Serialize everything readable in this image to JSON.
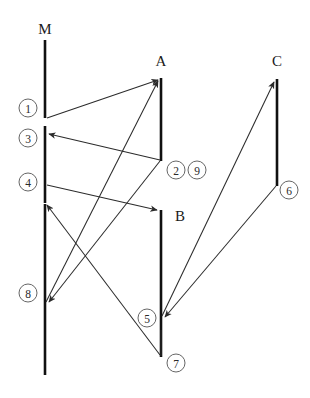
{
  "diagram": {
    "type": "sequence-diagram",
    "title": "",
    "canvas": {
      "width": 310,
      "height": 398,
      "background": "#ffffff"
    },
    "stroke_colors": {
      "lifeline": "#111111",
      "message": "#2b2b2b",
      "circle": "#555555",
      "text": "#1a1a1a"
    },
    "lifelines": [
      {
        "id": "M",
        "label": "M",
        "label_x": 45,
        "label_y": 30,
        "x": 45,
        "segments": [
          [
            40,
            118
          ],
          [
            126,
            203
          ],
          [
            203,
            375
          ]
        ]
      },
      {
        "id": "A",
        "label": "A",
        "label_x": 161,
        "label_y": 62,
        "x": 161,
        "segments": [
          [
            78,
            161
          ]
        ]
      },
      {
        "id": "B",
        "label": "B",
        "label_x": 178,
        "label_y": 216,
        "x": 161,
        "segments": [
          [
            210,
            357
          ]
        ]
      },
      {
        "id": "C",
        "label": "C",
        "label_x": 277,
        "label_y": 62,
        "x": 277,
        "segments": [
          [
            79,
            186
          ]
        ]
      }
    ],
    "messages": [
      {
        "num": "1",
        "circle_x": 28,
        "circle_y": 108,
        "x1": 46,
        "y1": 118,
        "x2": 160,
        "y2": 79,
        "arrow": "end"
      },
      {
        "num": "2",
        "circle_x": 176,
        "circle_y": 170,
        "x1": 160,
        "y1": 160,
        "x2": 47,
        "y2": 134,
        "arrow": "end"
      },
      {
        "num": "3",
        "circle_x": 28,
        "circle_y": 138,
        "x1": 0,
        "y1": 0,
        "x2": 0,
        "y2": 0,
        "arrow": "none"
      },
      {
        "num": "4",
        "circle_x": 28,
        "circle_y": 182,
        "x1": 46,
        "y1": 185,
        "x2": 159,
        "y2": 210,
        "arrow": "end"
      },
      {
        "num": "5",
        "circle_x": 148,
        "circle_y": 318,
        "x1": 276,
        "y1": 186,
        "x2": 163,
        "y2": 317,
        "arrow": "end"
      },
      {
        "num": "6",
        "circle_x": 289,
        "circle_y": 190,
        "x1": 161,
        "y1": 316,
        "x2": 276,
        "y2": 81,
        "arrow": "end"
      },
      {
        "num": "7",
        "circle_x": 176,
        "circle_y": 363,
        "x1": 46,
        "y1": 206,
        "x2": 160,
        "y2": 355,
        "arrow": "none"
      },
      {
        "num": "8",
        "circle_x": 28,
        "circle_y": 293,
        "x1": 160,
        "y1": 160,
        "x2": 47,
        "y2": 304,
        "arrow": "end"
      },
      {
        "num": "9",
        "circle_x": 196,
        "circle_y": 170,
        "x1": 45,
        "y1": 302,
        "x2": 160,
        "y2": 80,
        "arrow": "end"
      }
    ],
    "extra_paths": [
      {
        "name": "m-to-lower-left-arrow",
        "x1": 46,
        "y1": 205,
        "x2": 46,
        "y2": 205
      }
    ]
  }
}
